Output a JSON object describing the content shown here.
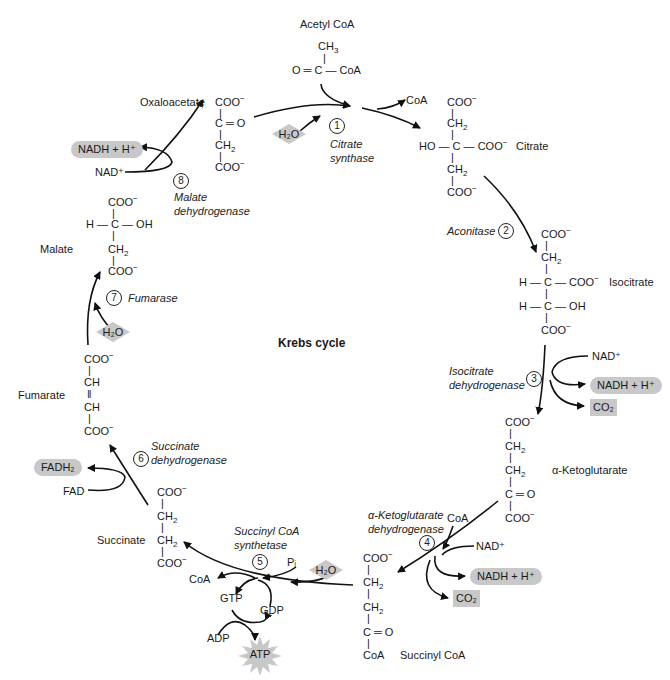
{
  "title": "Krebs cycle",
  "compounds": {
    "acetyl_coa": {
      "name": "Acetyl CoA",
      "lines": [
        "CH3",
        "O=C—CoA"
      ]
    },
    "oxaloacetate": {
      "name": "Oxaloacetate",
      "lines": [
        "COO⁻",
        "C=O",
        "CH2",
        "COO⁻"
      ]
    },
    "citrate": {
      "name": "Citrate",
      "lines": [
        "COO⁻",
        "CH2",
        "HO—C—COO⁻",
        "CH2",
        "COO⁻"
      ]
    },
    "isocitrate": {
      "name": "Isocitrate",
      "lines": [
        "COO⁻",
        "CH2",
        "H—C—COO⁻",
        "H—C—OH",
        "COO⁻"
      ]
    },
    "alpha_ketoglutarate": {
      "name": "α-Ketoglutarate",
      "lines": [
        "COO⁻",
        "CH2",
        "CH2",
        "C=O",
        "COO⁻"
      ]
    },
    "succinyl_coa": {
      "name": "Succinyl CoA",
      "lines": [
        "COO⁻",
        "CH2",
        "CH2",
        "C=O",
        "CoA"
      ]
    },
    "succinate": {
      "name": "Succinate",
      "lines": [
        "COO⁻",
        "CH2",
        "CH2",
        "COO⁻"
      ]
    },
    "fumarate": {
      "name": "Fumarate",
      "lines": [
        "COO⁻",
        "CH",
        "CH",
        "COO⁻"
      ]
    },
    "malate": {
      "name": "Malate",
      "lines": [
        "COO⁻",
        "H—C—OH",
        "CH2",
        "COO⁻"
      ]
    }
  },
  "steps": [
    {
      "number": "1",
      "enzyme": [
        "Citrate",
        "synthase"
      ]
    },
    {
      "number": "2",
      "enzyme": [
        "Aconitase"
      ]
    },
    {
      "number": "3",
      "enzyme": [
        "Isocitrate",
        "dehydrogenase"
      ]
    },
    {
      "number": "4",
      "enzyme": [
        "α-Ketoglutarate",
        "dehydrogenase"
      ]
    },
    {
      "number": "5",
      "enzyme": [
        "Succinyl CoA",
        "synthetase"
      ]
    },
    {
      "number": "6",
      "enzyme": [
        "Succinate",
        "dehydrogenase"
      ]
    },
    {
      "number": "7",
      "enzyme": [
        "Fumarase"
      ]
    },
    {
      "number": "8",
      "enzyme": [
        "Malate",
        "dehydrogenase"
      ]
    }
  ],
  "cofactors": {
    "coa": "CoA",
    "nad_plus": "NAD⁺",
    "nadh": "NADH + H⁺",
    "co2": "CO₂",
    "h2o": "H₂O",
    "pi": "Pᵢ",
    "gtp": "GTP",
    "gdp": "GDP",
    "adp": "ADP",
    "atp": "ATP",
    "fad": "FAD",
    "fadh2": "FADH₂"
  },
  "colors": {
    "highlight": "#c8c8c8",
    "ink": "#1a1a1a"
  }
}
